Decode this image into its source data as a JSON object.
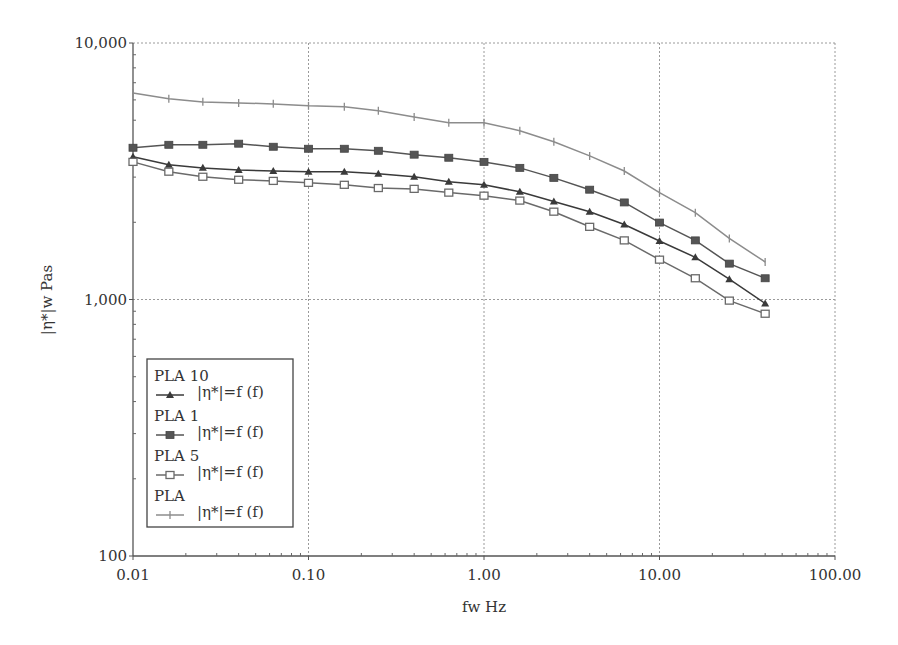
{
  "chart_data": {
    "type": "line",
    "title": "",
    "xlabel": "fw Hz",
    "ylabel": "|η*|w Pas",
    "xscale": "log",
    "yscale": "log",
    "xlim": [
      0.01,
      100
    ],
    "ylim": [
      100,
      10000
    ],
    "x_ticks": [
      0.01,
      0.1,
      1,
      10,
      100
    ],
    "x_tick_labels": [
      "0.01",
      "0.10",
      "1.00",
      "10.00",
      "100.00"
    ],
    "y_ticks": [
      100,
      1000,
      10000
    ],
    "y_tick_labels": [
      "100",
      "1,000",
      "10,000"
    ],
    "grid": true,
    "legend_position": "lower-left inside",
    "x": [
      0.01,
      0.016,
      0.025,
      0.04,
      0.063,
      0.1,
      0.16,
      0.25,
      0.4,
      0.63,
      1.0,
      1.6,
      2.5,
      4.0,
      6.3,
      10.0,
      16.0,
      25.0,
      40.0
    ],
    "series": [
      {
        "name": "PLA 10",
        "legend_label": "|η*|=f (f)",
        "marker": "triangle-filled",
        "color": "#3a3a3a",
        "values": [
          3600,
          3350,
          3260,
          3200,
          3170,
          3150,
          3150,
          3090,
          3010,
          2880,
          2800,
          2630,
          2410,
          2200,
          1960,
          1690,
          1460,
          1200,
          965
        ]
      },
      {
        "name": "PLA 1",
        "legend_label": "|η*|=f (f)",
        "marker": "square-filled",
        "color": "#555555",
        "values": [
          3905,
          4010,
          4010,
          4050,
          3940,
          3870,
          3870,
          3800,
          3670,
          3570,
          3440,
          3260,
          2980,
          2680,
          2390,
          1995,
          1700,
          1380,
          1210
        ]
      },
      {
        "name": "PLA 5",
        "legend_label": "|η*|=f (f)",
        "marker": "square-open",
        "color": "#6a6a6a",
        "values": [
          3440,
          3150,
          3010,
          2930,
          2900,
          2850,
          2800,
          2720,
          2700,
          2610,
          2540,
          2430,
          2200,
          1920,
          1700,
          1430,
          1210,
          990,
          880
        ]
      },
      {
        "name": "PLA",
        "legend_label": "|η*|=f (f)",
        "marker": "plus",
        "color": "#8c8c8c",
        "values": [
          6390,
          6060,
          5895,
          5840,
          5790,
          5690,
          5640,
          5440,
          5150,
          4890,
          4890,
          4550,
          4120,
          3630,
          3170,
          2610,
          2180,
          1730,
          1400
        ]
      }
    ]
  },
  "layout": {
    "plot_left": 133,
    "plot_right": 835,
    "plot_top": 43,
    "plot_bottom": 556,
    "legend_box": {
      "x": 147,
      "y": 359,
      "w": 146,
      "h": 168
    }
  }
}
